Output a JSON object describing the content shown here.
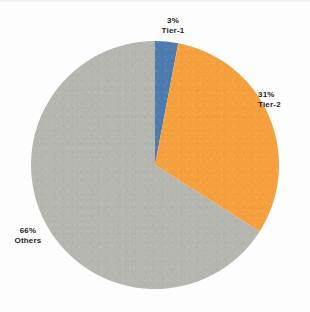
{
  "chart_data": {
    "type": "pie",
    "title": "",
    "subtitle": "",
    "xlabel": "",
    "ylabel": "",
    "legend_position": "none",
    "grid": false,
    "start_angle_deg": 0,
    "direction": "clockwise",
    "categories": [
      "Tier-1",
      "Tier-2",
      "Others"
    ],
    "values": [
      3,
      31,
      66
    ],
    "value_unit": "%",
    "slices": [
      {
        "name": "Tier-1",
        "value": 3,
        "percent_label": "3%",
        "color": "#4B7BB0"
      },
      {
        "name": "Tier-2",
        "value": 31,
        "percent_label": "31%",
        "color": "#F5A03C"
      },
      {
        "name": "Others",
        "value": 66,
        "percent_label": "66%",
        "color": "#B6B6B0"
      }
    ]
  },
  "labels": {
    "tier1": {
      "percent": "3%",
      "name": "Tier-1"
    },
    "tier2": {
      "percent": "31%",
      "name": "Tier-2"
    },
    "others": {
      "percent": "66%",
      "name": "Others"
    }
  },
  "colors": {
    "tier1": "#4B7BB0",
    "tier2": "#F5A03C",
    "others": "#B6B6B0",
    "background": "#FDFDFD",
    "label_text": "#1D1D1D"
  }
}
